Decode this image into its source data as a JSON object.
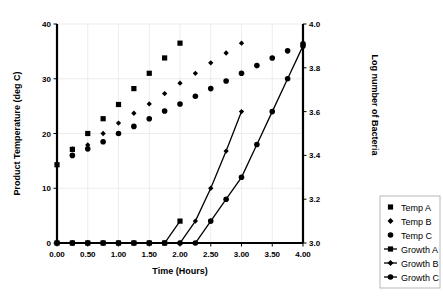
{
  "chart_data": {
    "type": "scatter",
    "title": "",
    "xlabel": "Time (Hours)",
    "ylabel": "Product Temperature (deg C)",
    "y2label": "Log number of Bacteria",
    "xlim": [
      0.0,
      4.0
    ],
    "ylim": [
      0,
      40
    ],
    "y2lim": [
      3.0,
      4.0
    ],
    "xticks": [
      "0.00",
      "0.50",
      "1.00",
      "1.50",
      "2.00",
      "2.50",
      "3.00",
      "3.50",
      "4.00"
    ],
    "xtick_values": [
      0.0,
      0.5,
      1.0,
      1.5,
      2.0,
      2.5,
      3.0,
      3.5,
      4.0
    ],
    "yticks": [
      "0",
      "10",
      "20",
      "30",
      "40"
    ],
    "ytick_values": [
      0,
      10,
      20,
      30,
      40
    ],
    "y2ticks": [
      "3.0",
      "3.2",
      "3.4",
      "3.6",
      "3.8",
      "4.0"
    ],
    "y2tick_values": [
      3.0,
      3.2,
      3.4,
      3.6,
      3.8,
      4.0
    ],
    "grid": true,
    "legend_position": "right",
    "series": [
      {
        "name": "Temp A",
        "axis": "left",
        "marker": "square",
        "mode": "markers",
        "x": [
          0.0,
          0.25,
          0.5,
          0.75,
          1.0,
          1.25,
          1.5,
          1.75,
          2.0,
          2.25,
          2.5,
          2.75,
          3.0
        ],
        "y": [
          14.3,
          17.1,
          20.0,
          22.7,
          25.3,
          28.2,
          31.0,
          33.8,
          36.5,
          null,
          null,
          null,
          null
        ]
      },
      {
        "name": "Temp B",
        "axis": "left",
        "marker": "diamond",
        "mode": "markers",
        "x": [
          0.25,
          0.5,
          0.75,
          1.0,
          1.25,
          1.5,
          1.75,
          2.0,
          2.25,
          2.5,
          2.75,
          3.0
        ],
        "y": [
          17.2,
          17.9,
          20.0,
          21.9,
          23.7,
          25.4,
          27.3,
          29.2,
          31.0,
          32.9,
          34.7,
          36.5
        ]
      },
      {
        "name": "Temp C",
        "axis": "left",
        "marker": "circle",
        "mode": "markers",
        "x": [
          0.25,
          0.5,
          0.75,
          1.0,
          1.25,
          1.5,
          1.75,
          2.0,
          2.25,
          2.5,
          2.75,
          3.0,
          3.25,
          3.5,
          3.75,
          4.0
        ],
        "y": [
          16.0,
          17.2,
          18.5,
          20.0,
          21.3,
          22.7,
          24.1,
          25.4,
          26.8,
          28.2,
          29.6,
          31.0,
          32.4,
          33.8,
          35.1,
          36.4
        ]
      },
      {
        "name": "Growth A",
        "axis": "right",
        "marker": "square",
        "mode": "lines+markers",
        "x": [
          0.0,
          0.25,
          0.5,
          0.75,
          1.0,
          1.25,
          1.5,
          1.75,
          2.0
        ],
        "y": [
          3.0,
          3.0,
          3.0,
          3.0,
          3.0,
          3.0,
          3.0,
          3.0,
          3.1
        ]
      },
      {
        "name": "Growth B",
        "axis": "right",
        "marker": "diamond",
        "mode": "lines+markers",
        "x": [
          0.0,
          0.25,
          0.5,
          0.75,
          1.0,
          1.25,
          1.5,
          1.75,
          2.0,
          2.25,
          2.5,
          2.75,
          3.0
        ],
        "y": [
          3.0,
          3.0,
          3.0,
          3.0,
          3.0,
          3.0,
          3.0,
          3.0,
          3.0,
          3.1,
          3.25,
          3.42,
          3.6
        ]
      },
      {
        "name": "Growth C",
        "axis": "right",
        "marker": "circle",
        "mode": "lines+markers",
        "x": [
          0.0,
          0.25,
          0.5,
          0.75,
          1.0,
          1.25,
          1.5,
          1.75,
          2.0,
          2.25,
          2.5,
          2.75,
          3.0,
          3.25,
          3.5,
          3.75,
          4.0
        ],
        "y": [
          3.0,
          3.0,
          3.0,
          3.0,
          3.0,
          3.0,
          3.0,
          3.0,
          3.0,
          3.0,
          3.1,
          3.2,
          3.3,
          3.45,
          3.6,
          3.75,
          3.9
        ]
      }
    ],
    "legend": [
      {
        "label": "Temp A",
        "marker": "square",
        "line": false
      },
      {
        "label": "Temp B",
        "marker": "diamond",
        "line": false
      },
      {
        "label": "Temp C",
        "marker": "circle",
        "line": false
      },
      {
        "label": "Growth A",
        "marker": "square",
        "line": true
      },
      {
        "label": "Growth B",
        "marker": "diamond",
        "line": true
      },
      {
        "label": "Growth C",
        "marker": "circle",
        "line": true
      }
    ]
  },
  "colors": {
    "ink": "#000000",
    "grid": "#e8e8e8",
    "legend_border": "#b8b8b8",
    "background": "#ffffff"
  }
}
